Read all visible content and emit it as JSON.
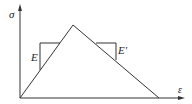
{
  "diagram": {
    "axes": {
      "y_label": "σ",
      "x_label": "ε"
    },
    "labels": {
      "loading_modulus": "E",
      "softening_modulus": "E'"
    },
    "colors": {
      "line": "#333333",
      "background": "#ffffff"
    }
  }
}
